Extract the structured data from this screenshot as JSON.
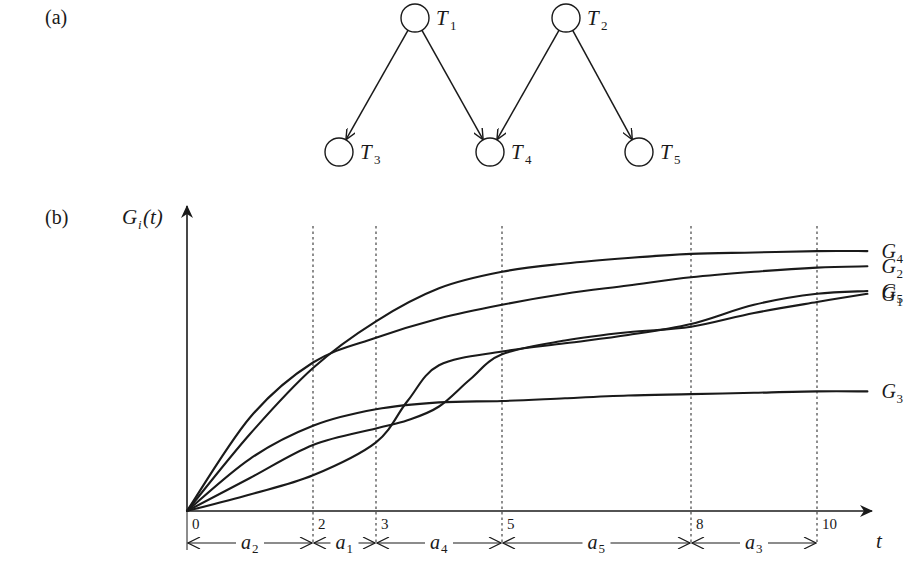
{
  "panel_a": {
    "label": "(a)",
    "nodes": [
      {
        "id": "T1",
        "name": "T",
        "sub": "1",
        "cx": 415,
        "cy": 18
      },
      {
        "id": "T2",
        "name": "T",
        "sub": "2",
        "cx": 566,
        "cy": 18
      },
      {
        "id": "T3",
        "name": "T",
        "sub": "3",
        "cx": 339,
        "cy": 152
      },
      {
        "id": "T4",
        "name": "T",
        "sub": "4",
        "cx": 490,
        "cy": 152
      },
      {
        "id": "T5",
        "name": "T",
        "sub": "5",
        "cx": 639,
        "cy": 152
      }
    ],
    "edges": [
      {
        "from": "T1",
        "to": "T3"
      },
      {
        "from": "T1",
        "to": "T4"
      },
      {
        "from": "T2",
        "to": "T4"
      },
      {
        "from": "T2",
        "to": "T5"
      }
    ]
  },
  "panel_b": {
    "label": "(b)",
    "ylabel_main": "G",
    "ylabel_sub": "i",
    "ylabel_tail": "(t)",
    "xlabel": "t"
  },
  "chart_data": {
    "type": "line",
    "title": "",
    "xlabel": "t",
    "ylabel": "G_i(t)",
    "x_ticks": [
      0,
      2,
      3,
      5,
      8,
      10
    ],
    "xlim": [
      0,
      11
    ],
    "grid": "vertical dashed lines at t = 2, 3, 5, 8, 10",
    "intervals": [
      {
        "label": "a",
        "sub": "2",
        "from": 0,
        "to": 2
      },
      {
        "label": "a",
        "sub": "1",
        "from": 2,
        "to": 3
      },
      {
        "label": "a",
        "sub": "4",
        "from": 3,
        "to": 5
      },
      {
        "label": "a",
        "sub": "5",
        "from": 5,
        "to": 8
      },
      {
        "label": "a",
        "sub": "3",
        "from": 8,
        "to": 10
      }
    ],
    "series": [
      {
        "name": "G4",
        "label": "G",
        "sub": "4",
        "x": [
          0,
          1,
          2,
          3,
          4,
          5,
          6,
          7,
          8,
          9,
          10,
          10.8
        ],
        "y": [
          0,
          0.28,
          0.52,
          0.69,
          0.81,
          0.87,
          0.9,
          0.92,
          0.935,
          0.94,
          0.945,
          0.945
        ]
      },
      {
        "name": "G2",
        "label": "G",
        "sub": "2",
        "x": [
          0,
          1,
          2,
          3,
          4,
          5,
          6,
          7,
          8,
          9,
          10,
          10.8
        ],
        "y": [
          0,
          0.34,
          0.54,
          0.63,
          0.7,
          0.75,
          0.79,
          0.82,
          0.85,
          0.87,
          0.885,
          0.89
        ]
      },
      {
        "name": "G5",
        "label": "G",
        "sub": "5",
        "x": [
          0,
          1,
          2,
          3,
          3.5,
          4,
          5,
          6,
          7,
          8,
          9,
          10,
          10.8
        ],
        "y": [
          0,
          0.06,
          0.13,
          0.25,
          0.4,
          0.53,
          0.58,
          0.61,
          0.64,
          0.68,
          0.75,
          0.79,
          0.8
        ]
      },
      {
        "name": "G3",
        "label": "G",
        "sub": "3",
        "x": [
          0,
          1,
          2,
          3,
          4,
          5,
          6,
          7,
          8,
          9,
          10,
          10.8
        ],
        "y": [
          0,
          0.19,
          0.31,
          0.37,
          0.395,
          0.4,
          0.41,
          0.42,
          0.425,
          0.43,
          0.435,
          0.435
        ]
      },
      {
        "name": "G1",
        "label": "G",
        "sub": "1",
        "x": [
          0,
          1,
          2,
          3,
          3.5,
          4,
          4.5,
          5,
          6,
          7,
          8,
          9,
          10,
          10.8
        ],
        "y": [
          0,
          0.12,
          0.24,
          0.3,
          0.33,
          0.38,
          0.48,
          0.57,
          0.62,
          0.65,
          0.67,
          0.72,
          0.76,
          0.79
        ]
      }
    ],
    "legend_position": "labels at right end of each curve, top-to-bottom: G4, G2, G5, G3, G1"
  }
}
